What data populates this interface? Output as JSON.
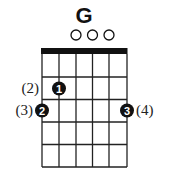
{
  "chord": {
    "name": "G",
    "strings": 6,
    "frets_shown": 5,
    "open_strings": [
      3,
      4,
      5
    ],
    "fingers": [
      {
        "finger": "1",
        "string": 2,
        "fret": 2,
        "label": "(2)",
        "label_side": "left"
      },
      {
        "finger": "2",
        "string": 1,
        "fret": 3,
        "label": "(3)",
        "label_side": "left"
      },
      {
        "finger": "3",
        "string": 6,
        "fret": 3,
        "label": "(4)",
        "label_side": "right"
      }
    ]
  },
  "colors": {
    "ink": "#111111",
    "background": "#ffffff"
  }
}
